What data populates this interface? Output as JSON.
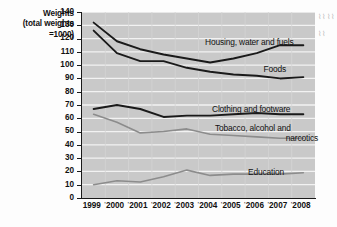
{
  "axis_caption": {
    "line1": "Weights",
    "line2": "(total weights",
    "line3": "=1000)"
  },
  "chart_data": {
    "type": "line",
    "title": "",
    "xlabel": "",
    "ylabel": "Weights (total weights =1000)",
    "x": [
      1999,
      2000,
      2001,
      2002,
      2003,
      2004,
      2005,
      2006,
      2007,
      2008
    ],
    "categories": [
      "1999",
      "2000",
      "2001",
      "2002",
      "2003",
      "2004",
      "2005",
      "2006",
      "2007",
      "2008"
    ],
    "ylim": [
      0,
      140
    ],
    "yticks": [
      0,
      10,
      20,
      30,
      40,
      50,
      60,
      70,
      80,
      90,
      100,
      110,
      120,
      130,
      140
    ],
    "grid": true,
    "grid_color": "#f2f2f2",
    "plot_background": "#c9c9c9",
    "legend": "inline-labels",
    "series": [
      {
        "name": "Housing, water and fuels",
        "color": "#1a1a1a",
        "values": [
          132,
          118,
          112,
          108,
          105,
          102,
          105,
          109,
          115,
          115
        ]
      },
      {
        "name": "Foods",
        "color": "#1a1a1a",
        "values": [
          126,
          109,
          103,
          103,
          98,
          95,
          93,
          92,
          90,
          91
        ]
      },
      {
        "name": "Clothing and footware",
        "color": "#1a1a1a",
        "values": [
          67,
          70,
          67,
          61,
          62,
          62,
          63,
          64,
          63,
          63
        ]
      },
      {
        "name": "Tobacco, alcohol and narcotics",
        "color": "#8c8c8c",
        "values": [
          63,
          57,
          49,
          50,
          52,
          48,
          47,
          46,
          45,
          45
        ]
      },
      {
        "name": "Education",
        "color": "#8c8c8c",
        "values": [
          10,
          13,
          12,
          16,
          21,
          17,
          18,
          18,
          18,
          19
        ]
      }
    ],
    "annotations": [
      {
        "text": "Housing, water and fuels",
        "series": "Housing, water and fuels"
      },
      {
        "text": "Foods",
        "series": "Foods"
      },
      {
        "text": "Clothing and footware",
        "series": "Clothing and footware"
      },
      {
        "text": "Tobacco, alcohol and",
        "series": "Tobacco, alcohol and narcotics"
      },
      {
        "text": "narcotics",
        "series": "Tobacco, alcohol and narcotics"
      },
      {
        "text": "Education",
        "series": "Education"
      }
    ]
  }
}
